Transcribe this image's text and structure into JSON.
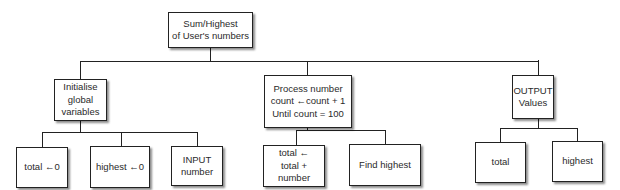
{
  "diagram": {
    "type": "structure chart",
    "root": {
      "label": "Sum/Highest\nof User's numbers"
    },
    "level1": [
      {
        "label": "Initialise\nglobal\nvariables",
        "children": [
          {
            "label": "total ←0"
          },
          {
            "label": "highest ←0"
          },
          {
            "label": "INPUT\nnumber"
          }
        ]
      },
      {
        "label": "Process number\ncount ←count + 1\nUntil count = 100",
        "children": [
          {
            "label": "total ←\ntotal + number"
          },
          {
            "label": "Find highest"
          }
        ]
      },
      {
        "label": "OUTPUT\nValues",
        "children": [
          {
            "label": "total"
          },
          {
            "label": "highest"
          }
        ]
      }
    ]
  }
}
